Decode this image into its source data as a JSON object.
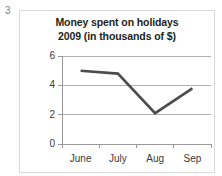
{
  "page_number": "3",
  "chart_data": {
    "type": "line",
    "title": "Money spent on holidays 2009 (in thousands of $)",
    "title_lines": [
      "Money spent on holidays",
      "2009 (in thousands  of $)"
    ],
    "xlabel": "",
    "ylabel": "",
    "categories": [
      "June",
      "July",
      "Aug",
      "Sep"
    ],
    "values": [
      5.0,
      4.8,
      2.1,
      3.8
    ],
    "series": [
      {
        "name": "Money spent",
        "values": [
          5.0,
          4.8,
          2.1,
          3.8
        ]
      }
    ],
    "ylim": [
      0,
      6
    ],
    "y_ticks": [
      "0",
      "2",
      "4",
      "6"
    ],
    "y_tick_values": [
      0,
      2,
      4,
      6
    ],
    "grid": true,
    "grid_axis": "y",
    "legend": false,
    "legend_position": "none",
    "colors": {
      "line": "#4d4d4d",
      "grid": "#b3b3b3",
      "axis": "#999999",
      "frame": "#d8d8d8",
      "text": "#231f20",
      "page_number": "#808080"
    }
  }
}
